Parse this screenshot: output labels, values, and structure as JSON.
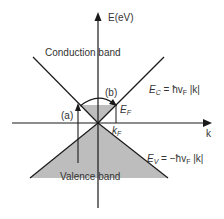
{
  "diagram": {
    "axes": {
      "vertical_label": "E(eV)",
      "horizontal_label": "k"
    },
    "regions": {
      "conduction_band": "Conduction band",
      "valence_band": "Valence band"
    },
    "labels": {
      "fermi_energy": "E",
      "fermi_energy_sub": "F",
      "fermi_wavevector": "k",
      "fermi_wavevector_sub": "F",
      "transition_a": "(a)",
      "transition_b": "(b)"
    },
    "equations": {
      "conduction": {
        "lhs": "E",
        "lhs_sub": "C",
        "rhs_prefix": " = ħv",
        "rhs_sub": "F",
        "rhs_suffix": " |k|"
      },
      "valence": {
        "lhs": "E",
        "lhs_sub": "V",
        "rhs_prefix": " = −ħv",
        "rhs_sub": "F",
        "rhs_suffix": " |k|"
      }
    },
    "colors": {
      "line": "#1a1a1a",
      "fill": "#bdbdbd",
      "text": "#333333",
      "background": "#ffffff"
    }
  }
}
